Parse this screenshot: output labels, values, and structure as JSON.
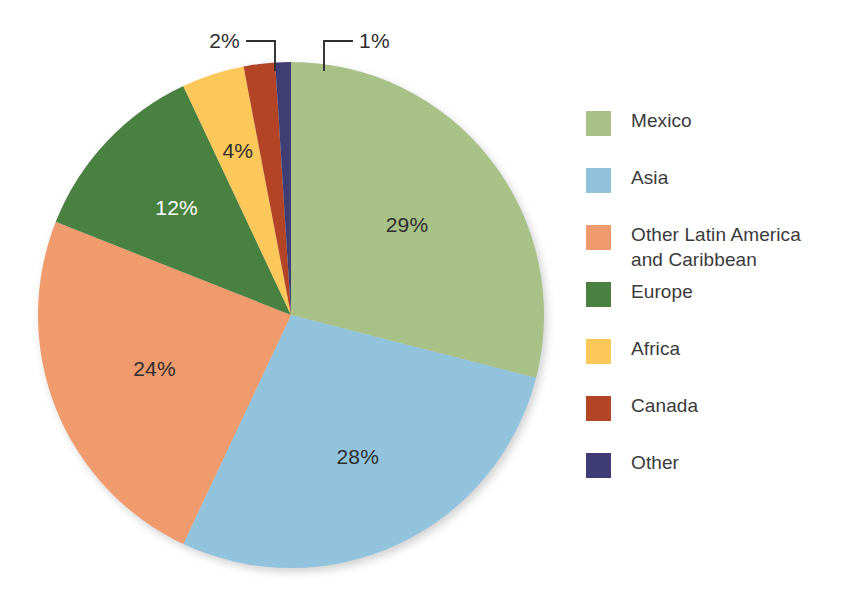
{
  "chart_data": {
    "type": "pie",
    "title": "",
    "subtitle": "",
    "xlabel": "",
    "ylabel": "",
    "grid": false,
    "legend_position": "right",
    "start_angle_deg": 0,
    "direction": "clockwise",
    "units": "percent",
    "categories": [
      "Mexico",
      "Asia",
      "Other Latin America and Caribbean",
      "Europe",
      "Africa",
      "Canada",
      "Other"
    ],
    "values": [
      29,
      28,
      24,
      12,
      4,
      2,
      1
    ],
    "data_labels": [
      "29%",
      "28%",
      "24%",
      "12%",
      "4%",
      "2%",
      "1%"
    ],
    "colors": [
      "#a8c187",
      "#92c3dd",
      "#ef9b6d",
      "#4a8141",
      "#fcc85a",
      "#b34425",
      "#3f3c75"
    ],
    "label_text_colors": [
      "#2e2e2e",
      "#2e2e2e",
      "#2e2e2e",
      "#ffffff",
      "#2e2e2e",
      "#2e2e2e",
      "#2e2e2e"
    ],
    "callout_slices": [
      "Canada",
      "Other"
    ]
  },
  "legend": {
    "items": [
      {
        "label": "Mexico",
        "color": "#a8c187",
        "value": "29%"
      },
      {
        "label": "Asia",
        "color": "#92c3dd",
        "value": "28%"
      },
      {
        "label": "Other Latin America\nand Caribbean",
        "color": "#ef9b6d",
        "value": "24%"
      },
      {
        "label": "Europe",
        "color": "#4a8141",
        "value": "12%"
      },
      {
        "label": "Africa",
        "color": "#fcc85a",
        "value": "4%"
      },
      {
        "label": "Canada",
        "color": "#b34425",
        "value": "2%"
      },
      {
        "label": "Other",
        "color": "#3f3c75",
        "value": "1%"
      }
    ]
  },
  "pie_labels": {
    "mexico": "29%",
    "asia": "28%",
    "latin_america": "24%",
    "europe": "12%",
    "africa": "4%",
    "canada": "2%",
    "other": "1%"
  },
  "geometry": {
    "center_x": 291,
    "center_y": 315,
    "radius": 253
  }
}
